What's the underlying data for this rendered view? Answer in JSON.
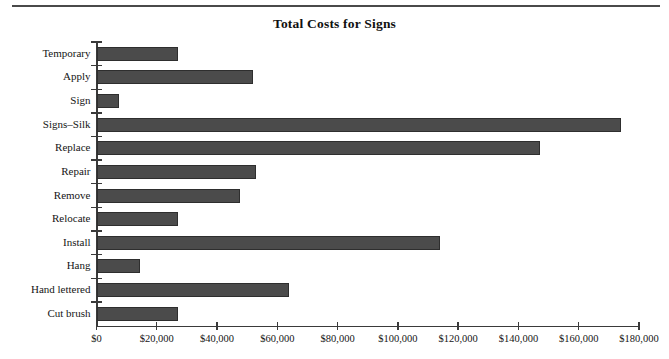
{
  "figure": {
    "title": "Total Costs for Signs",
    "has_top_rule": true,
    "bar_color": "#4b4b4b",
    "bar_edge_color": "#2e2e2e",
    "axis_color": "#3a3a3a",
    "background": "#ffffff"
  },
  "chart_data": {
    "type": "bar",
    "orientation": "horizontal",
    "title": "Total Costs for Signs",
    "xlabel": "",
    "ylabel": "",
    "xlim": [
      0,
      180000
    ],
    "xtick_values": [
      0,
      20000,
      40000,
      60000,
      80000,
      100000,
      120000,
      140000,
      160000,
      180000
    ],
    "xtick_labels": [
      "$0",
      "$20,000",
      "$40,000",
      "$60,000",
      "$80,000",
      "$100,000",
      "$120,000",
      "$140,000",
      "$160,000",
      "$180,000"
    ],
    "grid": false,
    "legend": null,
    "categories": [
      "Temporary",
      "Apply",
      "Sign",
      "Signs–Silk",
      "Replace",
      "Repair",
      "Remove",
      "Relocate",
      "Install",
      "Hang",
      "Hand lettered",
      "Cut brush"
    ],
    "values": [
      27000,
      52000,
      7500,
      174000,
      147000,
      53000,
      47500,
      27000,
      114000,
      14500,
      64000,
      27000
    ]
  }
}
